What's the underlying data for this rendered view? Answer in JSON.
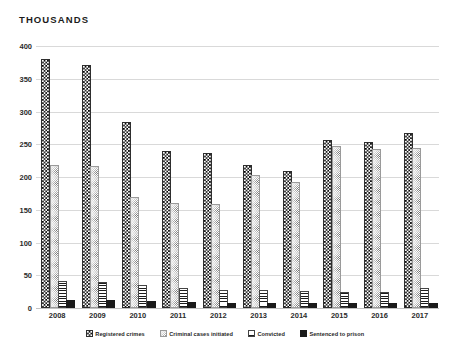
{
  "chart_data": {
    "type": "bar",
    "title": "THOUSANDS",
    "xlabel": "",
    "ylabel": "THOUSANDS",
    "ylim": [
      0,
      400
    ],
    "yticks": [
      0,
      50,
      100,
      150,
      200,
      250,
      300,
      350,
      400
    ],
    "grid": true,
    "legend_position": "bottom",
    "categories": [
      "2008",
      "2009",
      "2010",
      "2011",
      "2012",
      "2013",
      "2014",
      "2015",
      "2016",
      "2017"
    ],
    "series": [
      {
        "name": "Registered crimes",
        "pattern": "checkerboard",
        "color": "#1a1a1a",
        "values": [
          377,
          368,
          281,
          236,
          233,
          215,
          206,
          253,
          251,
          264
        ]
      },
      {
        "name": "Criminal cases initiated",
        "pattern": "stipple",
        "color": "#8c8c8c",
        "values": [
          215,
          214,
          166,
          158,
          155,
          200,
          189,
          244,
          239,
          241
        ]
      },
      {
        "name": "Convicted",
        "pattern": "horizontal-hatch",
        "color": "#333333",
        "values": [
          38,
          37,
          32,
          28,
          24,
          24,
          23,
          22,
          21,
          27
        ]
      },
      {
        "name": "Sentenced to prison",
        "pattern": "solid",
        "color": "#1a1a1a",
        "values": [
          9,
          9,
          7,
          6,
          5,
          5,
          5,
          5,
          5,
          5
        ]
      }
    ]
  }
}
